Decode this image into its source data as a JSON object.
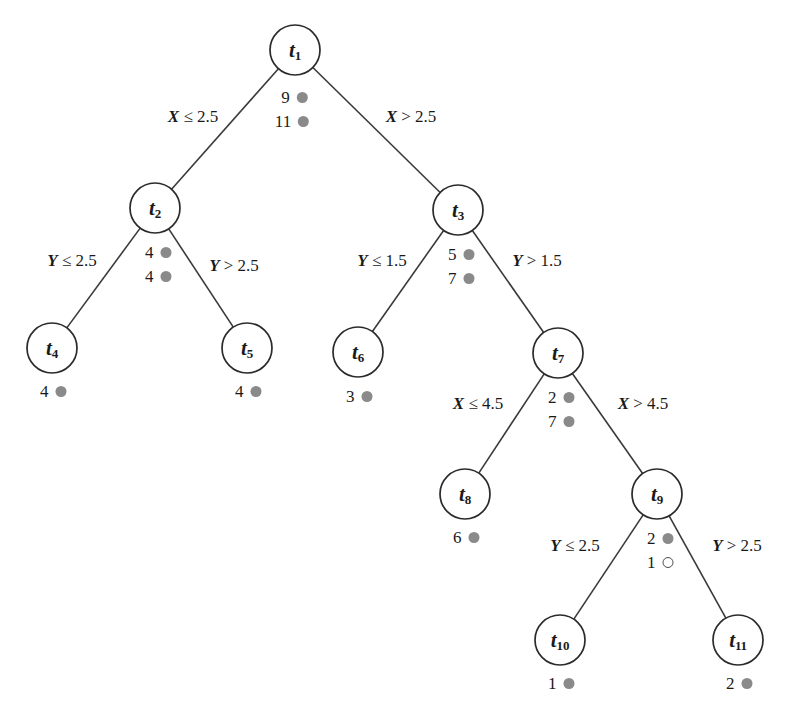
{
  "diagram": {
    "type": "decision-tree",
    "title": "",
    "node_radius": 25,
    "marker_colors": {
      "filled": "#8a8a8a",
      "open_stroke": "#4a4a4a"
    },
    "nodes": [
      {
        "id": "t1",
        "label": "t",
        "subscript": "1",
        "x": 295,
        "y": 50,
        "leaf": false,
        "counts": [
          {
            "value": "9",
            "marker": "filled"
          },
          {
            "value": "11",
            "marker": "filled"
          }
        ],
        "counts_x": 292,
        "counts_y": 88,
        "counts_align": "center"
      },
      {
        "id": "t2",
        "label": "t",
        "subscript": "2",
        "x": 155,
        "y": 208,
        "leaf": false,
        "counts": [
          {
            "value": "4",
            "marker": "filled"
          },
          {
            "value": "4",
            "marker": "filled"
          }
        ],
        "counts_x": 155,
        "counts_y": 243,
        "counts_align": "center"
      },
      {
        "id": "t3",
        "label": "t",
        "subscript": "3",
        "x": 458,
        "y": 210,
        "leaf": false,
        "counts": [
          {
            "value": "5",
            "marker": "filled"
          },
          {
            "value": "7",
            "marker": "filled"
          }
        ],
        "counts_x": 458,
        "counts_y": 245,
        "counts_align": "center"
      },
      {
        "id": "t4",
        "label": "t",
        "subscript": "4",
        "x": 52,
        "y": 348,
        "leaf": true,
        "counts": [
          {
            "value": "4",
            "marker": "filled"
          }
        ],
        "counts_x": 50,
        "counts_y": 382,
        "counts_align": "center"
      },
      {
        "id": "t5",
        "label": "t",
        "subscript": "5",
        "x": 247,
        "y": 348,
        "leaf": true,
        "counts": [
          {
            "value": "4",
            "marker": "filled"
          }
        ],
        "counts_x": 245,
        "counts_y": 382,
        "counts_align": "center"
      },
      {
        "id": "t6",
        "label": "t",
        "subscript": "6",
        "x": 358,
        "y": 352,
        "leaf": true,
        "counts": [
          {
            "value": "3",
            "marker": "filled"
          }
        ],
        "counts_x": 356,
        "counts_y": 387,
        "counts_align": "center"
      },
      {
        "id": "t7",
        "label": "t",
        "subscript": "7",
        "x": 558,
        "y": 353,
        "leaf": false,
        "counts": [
          {
            "value": "2",
            "marker": "filled"
          },
          {
            "value": "7",
            "marker": "filled"
          }
        ],
        "counts_x": 558,
        "counts_y": 388,
        "counts_align": "center"
      },
      {
        "id": "t8",
        "label": "t",
        "subscript": "8",
        "x": 465,
        "y": 494,
        "leaf": true,
        "counts": [
          {
            "value": "6",
            "marker": "filled"
          }
        ],
        "counts_x": 463,
        "counts_y": 528,
        "counts_align": "center"
      },
      {
        "id": "t9",
        "label": "t",
        "subscript": "9",
        "x": 657,
        "y": 494,
        "leaf": false,
        "counts": [
          {
            "value": "2",
            "marker": "filled"
          },
          {
            "value": "1",
            "marker": "open"
          }
        ],
        "counts_x": 657,
        "counts_y": 529,
        "counts_align": "center"
      },
      {
        "id": "t10",
        "label": "t",
        "subscript": "10",
        "x": 560,
        "y": 640,
        "leaf": true,
        "counts": [
          {
            "value": "1",
            "marker": "filled"
          }
        ],
        "counts_x": 558,
        "counts_y": 674,
        "counts_align": "center"
      },
      {
        "id": "t11",
        "label": "t",
        "subscript": "11",
        "x": 738,
        "y": 640,
        "leaf": true,
        "counts": [
          {
            "value": "2",
            "marker": "filled"
          }
        ],
        "counts_x": 736,
        "counts_y": 674,
        "counts_align": "center"
      }
    ],
    "edges": [
      {
        "from": "t1",
        "to": "t2",
        "variable": "X",
        "operator": "≤",
        "threshold": "2.5",
        "label": "X ≤ 2.5",
        "label_x": 193,
        "label_y": 117
      },
      {
        "from": "t1",
        "to": "t3",
        "variable": "X",
        "operator": ">",
        "threshold": "2.5",
        "label": "X > 2.5",
        "label_x": 411,
        "label_y": 117
      },
      {
        "from": "t2",
        "to": "t4",
        "variable": "Y",
        "operator": "≤",
        "threshold": "2.5",
        "label": "Y ≤ 2.5",
        "label_x": 72,
        "label_y": 261
      },
      {
        "from": "t2",
        "to": "t5",
        "variable": "Y",
        "operator": ">",
        "threshold": "2.5",
        "label": "Y > 2.5",
        "label_x": 234,
        "label_y": 266
      },
      {
        "from": "t3",
        "to": "t6",
        "variable": "Y",
        "operator": "≤",
        "threshold": "1.5",
        "label": "Y ≤ 1.5",
        "label_x": 382,
        "label_y": 261
      },
      {
        "from": "t3",
        "to": "t7",
        "variable": "Y",
        "operator": ">",
        "threshold": "1.5",
        "label": "Y > 1.5",
        "label_x": 537,
        "label_y": 261
      },
      {
        "from": "t7",
        "to": "t8",
        "variable": "X",
        "operator": "≤",
        "threshold": "4.5",
        "label": "X ≤ 4.5",
        "label_x": 478,
        "label_y": 404
      },
      {
        "from": "t7",
        "to": "t9",
        "variable": "X",
        "operator": ">",
        "threshold": "4.5",
        "label": "X > 4.5",
        "label_x": 643,
        "label_y": 404
      },
      {
        "from": "t9",
        "to": "t10",
        "variable": "Y",
        "operator": "≤",
        "threshold": "2.5",
        "label": "Y ≤ 2.5",
        "label_x": 575,
        "label_y": 546
      },
      {
        "from": "t9",
        "to": "t11",
        "variable": "Y",
        "operator": ">",
        "threshold": "2.5",
        "label": "Y > 2.5",
        "label_x": 737,
        "label_y": 546
      }
    ]
  }
}
